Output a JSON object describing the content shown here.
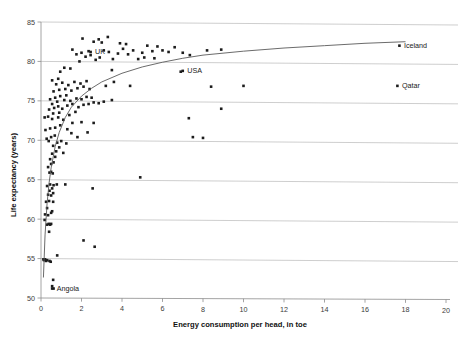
{
  "chart_data": {
    "type": "scatter",
    "title": "",
    "xlabel": "Energy consumption per head, in toe",
    "ylabel": "Life expectancy (years)",
    "xlim": [
      0,
      20
    ],
    "ylim": [
      50,
      85
    ],
    "xticks": [
      0,
      2,
      4,
      6,
      8,
      10,
      12,
      14,
      16,
      18,
      20
    ],
    "yticks": [
      50,
      55,
      60,
      65,
      70,
      75,
      80,
      85
    ],
    "xtick_labels": [
      "0",
      "2",
      "4",
      "6",
      "8",
      "10",
      "12",
      "14",
      "16",
      "18",
      "20"
    ],
    "ytick_labels": [
      "50",
      "55",
      "60",
      "65",
      "70",
      "75",
      "80",
      "85"
    ],
    "grid": "horizontal",
    "legend": "none",
    "marker": "square",
    "marker_color": "#1c1c1c",
    "trendline": {
      "kind": "logarithmic",
      "description": "Fitted logarithmic curve rising steeply from low energy use then flattening near 82 years",
      "points": [
        [
          0.12,
          52.6
        ],
        [
          0.2,
          58.0
        ],
        [
          0.3,
          62.0
        ],
        [
          0.4,
          64.6
        ],
        [
          0.5,
          66.5
        ],
        [
          0.7,
          69.2
        ],
        [
          0.9,
          71.0
        ],
        [
          1.2,
          72.9
        ],
        [
          1.5,
          74.2
        ],
        [
          2.0,
          75.6
        ],
        [
          2.5,
          76.6
        ],
        [
          3.0,
          77.4
        ],
        [
          4.0,
          78.5
        ],
        [
          5.0,
          79.3
        ],
        [
          6.0,
          79.9
        ],
        [
          7.0,
          80.4
        ],
        [
          8.0,
          80.8
        ],
        [
          10.0,
          81.3
        ],
        [
          12.0,
          81.7
        ],
        [
          14.0,
          82.0
        ],
        [
          16.0,
          82.3
        ],
        [
          18.0,
          82.5
        ]
      ]
    },
    "points": [
      [
        0.12,
        54.9
      ],
      [
        0.15,
        54.8
      ],
      [
        0.2,
        54.9
      ],
      [
        0.25,
        54.7
      ],
      [
        0.3,
        54.8
      ],
      [
        0.42,
        54.7
      ],
      [
        0.48,
        54.6
      ],
      [
        0.8,
        55.4
      ],
      [
        0.6,
        52.3
      ],
      [
        0.55,
        51.5
      ],
      [
        0.62,
        51.2
      ],
      [
        0.18,
        59.9
      ],
      [
        0.3,
        59.3
      ],
      [
        0.38,
        59.4
      ],
      [
        0.45,
        59.3
      ],
      [
        0.5,
        59.4
      ],
      [
        0.4,
        58.4
      ],
      [
        2.1,
        57.3
      ],
      [
        2.65,
        56.5
      ],
      [
        0.2,
        60.6
      ],
      [
        0.35,
        60.5
      ],
      [
        0.5,
        60.8
      ],
      [
        0.3,
        61.4
      ],
      [
        0.55,
        61.0
      ],
      [
        0.25,
        62.2
      ],
      [
        0.4,
        62.3
      ],
      [
        0.6,
        62.2
      ],
      [
        0.35,
        63.1
      ],
      [
        0.5,
        63.0
      ],
      [
        0.6,
        63.3
      ],
      [
        0.42,
        63.6
      ],
      [
        0.55,
        63.9
      ],
      [
        0.3,
        64.2
      ],
      [
        0.45,
        64.4
      ],
      [
        0.62,
        64.3
      ],
      [
        0.78,
        64.4
      ],
      [
        1.2,
        64.4
      ],
      [
        2.55,
        63.9
      ],
      [
        4.9,
        65.3
      ],
      [
        0.42,
        65.9
      ],
      [
        0.5,
        66.0
      ],
      [
        0.58,
        65.8
      ],
      [
        0.35,
        66.6
      ],
      [
        0.5,
        67.0
      ],
      [
        0.62,
        67.2
      ],
      [
        0.45,
        67.6
      ],
      [
        0.7,
        67.9
      ],
      [
        0.55,
        68.3
      ],
      [
        0.75,
        68.6
      ],
      [
        1.1,
        68.4
      ],
      [
        0.9,
        69.1
      ],
      [
        0.6,
        69.3
      ],
      [
        0.8,
        69.7
      ],
      [
        1.0,
        69.9
      ],
      [
        1.25,
        69.6
      ],
      [
        0.38,
        69.9
      ],
      [
        0.28,
        70.2
      ],
      [
        0.5,
        70.4
      ],
      [
        0.68,
        70.6
      ],
      [
        1.5,
        70.9
      ],
      [
        1.8,
        70.4
      ],
      [
        7.5,
        70.4
      ],
      [
        8.0,
        70.3
      ],
      [
        0.22,
        71.3
      ],
      [
        0.45,
        71.5
      ],
      [
        0.7,
        71.6
      ],
      [
        0.95,
        71.9
      ],
      [
        1.3,
        71.4
      ],
      [
        1.55,
        72.2
      ],
      [
        1.1,
        72.6
      ],
      [
        0.85,
        72.9
      ],
      [
        0.55,
        72.7
      ],
      [
        0.35,
        73.0
      ],
      [
        0.18,
        72.9
      ],
      [
        0.6,
        73.4
      ],
      [
        0.9,
        73.5
      ],
      [
        1.4,
        73.2
      ],
      [
        1.7,
        73.6
      ],
      [
        2.0,
        72.3
      ],
      [
        2.3,
        71.0
      ],
      [
        2.6,
        72.2
      ],
      [
        7.3,
        72.8
      ],
      [
        0.4,
        73.9
      ],
      [
        0.65,
        74.1
      ],
      [
        0.85,
        74.3
      ],
      [
        1.05,
        74.0
      ],
      [
        1.3,
        74.4
      ],
      [
        1.55,
        74.6
      ],
      [
        1.85,
        74.2
      ],
      [
        2.1,
        74.5
      ],
      [
        2.35,
        74.6
      ],
      [
        2.6,
        74.8
      ],
      [
        2.85,
        74.7
      ],
      [
        3.1,
        74.9
      ],
      [
        0.55,
        74.6
      ],
      [
        0.8,
        74.9
      ],
      [
        1.15,
        75.1
      ],
      [
        1.45,
        75.0
      ],
      [
        1.75,
        75.3
      ],
      [
        2.0,
        75.2
      ],
      [
        2.25,
        75.5
      ],
      [
        2.5,
        75.4
      ],
      [
        0.45,
        75.2
      ],
      [
        0.7,
        75.4
      ],
      [
        0.95,
        75.6
      ],
      [
        1.25,
        75.7
      ],
      [
        3.5,
        75.1
      ],
      [
        8.9,
        74.0
      ],
      [
        0.62,
        76.2
      ],
      [
        0.9,
        76.4
      ],
      [
        1.2,
        76.5
      ],
      [
        1.5,
        76.3
      ],
      [
        1.8,
        76.6
      ],
      [
        2.1,
        76.8
      ],
      [
        2.4,
        76.5
      ],
      [
        0.75,
        77.1
      ],
      [
        1.05,
        77.3
      ],
      [
        1.35,
        77.0
      ],
      [
        1.65,
        77.4
      ],
      [
        1.95,
        77.2
      ],
      [
        2.25,
        77.5
      ],
      [
        0.55,
        77.6
      ],
      [
        0.85,
        77.8
      ],
      [
        3.2,
        76.9
      ],
      [
        3.6,
        77.4
      ],
      [
        4.4,
        76.9
      ],
      [
        8.4,
        76.8
      ],
      [
        10.0,
        76.9
      ],
      [
        0.95,
        78.7
      ],
      [
        1.15,
        79.2
      ],
      [
        1.45,
        79.1
      ],
      [
        3.5,
        78.9
      ],
      [
        6.9,
        78.7
      ],
      [
        1.9,
        80.0
      ],
      [
        2.2,
        80.6
      ],
      [
        2.45,
        80.8
      ],
      [
        2.0,
        81.1
      ],
      [
        2.35,
        81.3
      ],
      [
        2.7,
        80.2
      ],
      [
        2.9,
        80.5
      ],
      [
        3.1,
        81.4
      ],
      [
        3.35,
        81.2
      ],
      [
        3.0,
        82.4
      ],
      [
        2.6,
        82.5
      ],
      [
        3.55,
        80.3
      ],
      [
        3.8,
        81.0
      ],
      [
        3.3,
        83.1
      ],
      [
        4.05,
        81.6
      ],
      [
        4.3,
        80.9
      ],
      [
        4.55,
        81.4
      ],
      [
        4.8,
        80.3
      ],
      [
        5.0,
        81.1
      ],
      [
        5.25,
        82.0
      ],
      [
        5.5,
        81.3
      ],
      [
        5.75,
        81.9
      ],
      [
        6.0,
        81.4
      ],
      [
        6.3,
        81.2
      ],
      [
        6.6,
        81.8
      ],
      [
        7.0,
        81.1
      ],
      [
        7.35,
        80.8
      ],
      [
        8.2,
        81.4
      ],
      [
        8.9,
        81.5
      ],
      [
        1.55,
        81.5
      ],
      [
        1.75,
        80.9
      ],
      [
        2.05,
        82.9
      ],
      [
        2.85,
        82.8
      ],
      [
        3.9,
        82.3
      ],
      [
        4.2,
        82.2
      ],
      [
        5.1,
        80.5
      ],
      [
        5.6,
        80.4
      ]
    ],
    "annotations": [
      {
        "label": "UK",
        "x": 2.45,
        "y": 81.2,
        "marker": true
      },
      {
        "label": "USA",
        "x": 7.0,
        "y": 78.8,
        "marker": true
      },
      {
        "label": "Angola",
        "x": 0.55,
        "y": 51.2,
        "marker": true
      },
      {
        "label": "Iceland",
        "x": 17.7,
        "y": 82.0,
        "marker": true
      },
      {
        "label": "Qatar",
        "x": 17.6,
        "y": 76.9,
        "marker": true
      }
    ]
  }
}
